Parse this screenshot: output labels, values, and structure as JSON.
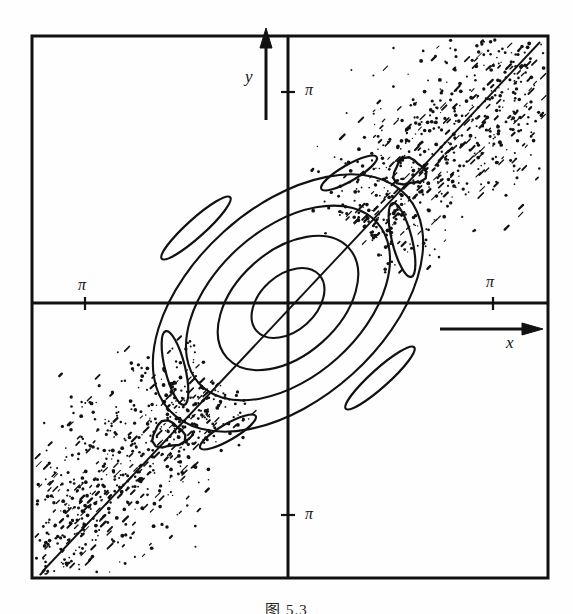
{
  "figure": {
    "caption_partial": "图 5.3",
    "background_color": "#fefefe",
    "ink_color": "#111111"
  },
  "axes": {
    "x_label": "x",
    "y_label": "y",
    "x_arrow": "arrow-right",
    "y_arrow": "arrow-up",
    "ticks": [
      {
        "name": "x-negative-pi",
        "label": "π",
        "axis": "x",
        "side": "left",
        "px": 85,
        "py": 303
      },
      {
        "name": "x-positive-pi",
        "label": "π",
        "axis": "x",
        "side": "right",
        "px": 493,
        "py": 303
      },
      {
        "name": "y-positive-pi",
        "label": "π",
        "axis": "y",
        "side": "top",
        "px": 288,
        "py": 92
      },
      {
        "name": "y-negative-pi",
        "label": "π",
        "axis": "y",
        "side": "bottom",
        "px": 288,
        "py": 515
      }
    ]
  },
  "frame": {
    "left": 32,
    "top": 36,
    "right": 548,
    "bottom": 578
  },
  "origin": {
    "x": 288,
    "y": 303
  },
  "chart_data": {
    "type": "scatter",
    "xlabel": "x",
    "ylabel": "y",
    "xlim": [
      -3.6,
      3.6
    ],
    "ylim": [
      -3.6,
      3.6
    ],
    "xtick_labels": [
      "π",
      "π"
    ],
    "ytick_labels": [
      "π",
      "π"
    ],
    "grid": false,
    "legend": null,
    "invariant_curves": [
      {
        "name": "torus-1",
        "cx": 288,
        "cy": 303,
        "rx": 42,
        "ry": 28,
        "rotation_deg": -42
      },
      {
        "name": "torus-2",
        "cx": 288,
        "cy": 303,
        "rx": 82,
        "ry": 52,
        "rotation_deg": -42
      },
      {
        "name": "torus-3",
        "cx": 288,
        "cy": 303,
        "rx": 120,
        "ry": 74,
        "rotation_deg": -42
      },
      {
        "name": "torus-4",
        "cx": 288,
        "cy": 303,
        "rx": 160,
        "ry": 96,
        "rotation_deg": -42
      }
    ],
    "separatrix_line": {
      "x1": 42,
      "y1": 572,
      "x2": 540,
      "y2": 42
    },
    "elliptic_islands": [
      {
        "name": "island-upper-right",
        "cx": 409,
        "cy": 172,
        "r": 15
      },
      {
        "name": "island-lower-left",
        "cx": 168,
        "cy": 435,
        "r": 15
      }
    ],
    "crescent_islands": [
      {
        "name": "crescent-upper-left",
        "cx": 196,
        "cy": 228,
        "rx": 46,
        "ry": 9,
        "rotation_deg": -42
      },
      {
        "name": "crescent-lower-right",
        "cx": 380,
        "cy": 378,
        "rx": 46,
        "ry": 9,
        "rotation_deg": -42
      },
      {
        "name": "crescent-left",
        "cx": 175,
        "cy": 368,
        "rx": 10,
        "ry": 38,
        "rotation_deg": -14
      },
      {
        "name": "crescent-right",
        "cx": 402,
        "cy": 240,
        "rx": 10,
        "ry": 38,
        "rotation_deg": -14
      },
      {
        "name": "crescent-top",
        "cx": 349,
        "cy": 173,
        "rx": 32,
        "ry": 8,
        "rotation_deg": -30
      },
      {
        "name": "crescent-bottom",
        "cx": 228,
        "cy": 432,
        "rx": 32,
        "ry": 8,
        "rotation_deg": -30
      }
    ],
    "chaotic_band": {
      "n_points": 1400,
      "axis_angle_deg": -45,
      "band_half_width": 58,
      "inner_exclusion": 96,
      "note": "Stochastic layer surrounding the separatrix; densest near the diagonal and thinning outward."
    }
  }
}
